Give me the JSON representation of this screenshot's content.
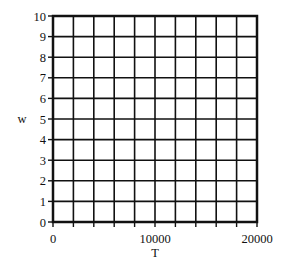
{
  "chart_data": {
    "type": "line",
    "title": "",
    "xlabel": "T",
    "ylabel": "w",
    "xlim": [
      0,
      20000
    ],
    "ylim": [
      0,
      10
    ],
    "x_ticks": [
      0,
      10000,
      20000
    ],
    "x_tick_labels": [
      "0",
      "10000",
      "20000"
    ],
    "y_ticks": [
      0,
      1,
      2,
      3,
      4,
      5,
      6,
      7,
      8,
      9,
      10
    ],
    "y_tick_labels": [
      "0",
      "1",
      "2",
      "3",
      "4",
      "5",
      "6",
      "7",
      "8",
      "9",
      "10"
    ],
    "x_grid_divisions": 10,
    "y_grid_divisions": 10,
    "grid": true,
    "series": [],
    "legend": null
  },
  "colors": {
    "grid": "#111111",
    "background": "#ffffff"
  }
}
